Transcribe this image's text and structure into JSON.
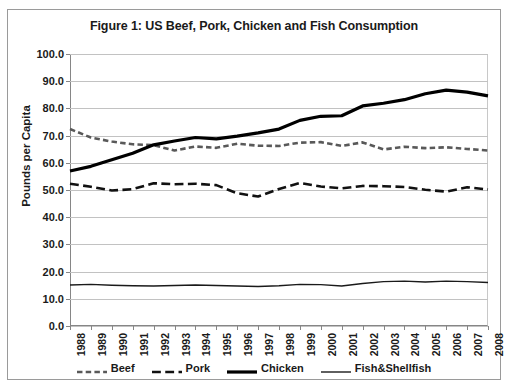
{
  "chart_data": {
    "type": "line",
    "title": "Figure 1: US Beef, Pork, Chicken and Fish Consumption",
    "xlabel": "",
    "ylabel": "Pounds per Capita",
    "ylim": [
      0,
      100
    ],
    "ytick_step": 10,
    "grid": true,
    "legend_position": "bottom",
    "x": [
      1988,
      1989,
      1990,
      1991,
      1992,
      1993,
      1994,
      1995,
      1996,
      1997,
      1998,
      1999,
      2000,
      2001,
      2002,
      2003,
      2004,
      2005,
      2006,
      2007,
      2008
    ],
    "ytick_labels": [
      "0.0",
      "10.0",
      "20.0",
      "30.0",
      "40.0",
      "50.0",
      "60.0",
      "70.0",
      "80.0",
      "90.0",
      "100.0"
    ],
    "xtick_labels": [
      "1988",
      "1989",
      "1990",
      "1991",
      "1992",
      "1993",
      "1994",
      "1995",
      "1996",
      "1997",
      "1998",
      "1999",
      "2000",
      "2001",
      "2002",
      "2003",
      "2004",
      "2005",
      "2006",
      "2007",
      "2008"
    ],
    "series": [
      {
        "name": "Beef",
        "style": "short-dash",
        "color": "#595959",
        "width": 2.6,
        "values": [
          72.4,
          69.3,
          67.8,
          66.8,
          66.5,
          64.5,
          66.0,
          65.5,
          67.0,
          66.3,
          66.2,
          67.4,
          67.6,
          66.2,
          67.5,
          64.9,
          65.9,
          65.4,
          65.7,
          65.1,
          64.5
        ]
      },
      {
        "name": "Pork",
        "style": "long-dash",
        "color": "#111111",
        "width": 2.6,
        "values": [
          52.3,
          51.2,
          49.8,
          50.3,
          52.5,
          52.1,
          52.3,
          51.8,
          48.8,
          47.6,
          50.4,
          52.6,
          51.3,
          50.6,
          51.5,
          51.4,
          51.1,
          50.1,
          49.4,
          51.0,
          50.2
        ]
      },
      {
        "name": "Chicken",
        "style": "solid",
        "color": "#000000",
        "width": 3.2,
        "values": [
          57.0,
          58.7,
          61.1,
          63.5,
          66.6,
          68.0,
          69.3,
          68.8,
          69.8,
          71.0,
          72.4,
          75.6,
          77.1,
          77.3,
          80.9,
          81.9,
          83.2,
          85.4,
          86.7,
          86.0,
          84.6
        ]
      },
      {
        "name": "Fish&Shellfish",
        "style": "solid",
        "color": "#1a1a1a",
        "width": 1.4,
        "values": [
          15.1,
          15.3,
          15.0,
          14.8,
          14.7,
          14.9,
          15.1,
          14.9,
          14.7,
          14.5,
          14.8,
          15.3,
          15.2,
          14.7,
          15.6,
          16.3,
          16.5,
          16.2,
          16.5,
          16.3,
          16.0
        ]
      }
    ]
  },
  "legend": [
    {
      "label": "Beef"
    },
    {
      "label": "Pork"
    },
    {
      "label": "Chicken"
    },
    {
      "label": "Fish&Shellfish"
    }
  ]
}
